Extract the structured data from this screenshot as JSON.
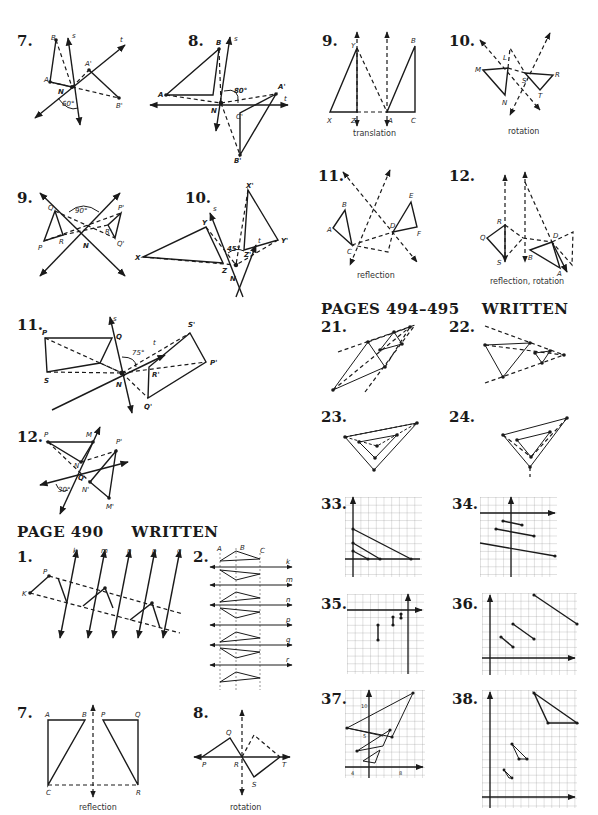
{
  "sections": {
    "page_490_written": "PAGE 490",
    "page_490_written_tag": "WRITTEN",
    "pages_494_495": "PAGES 494–495",
    "pages_494_495_tag": "WRITTEN"
  },
  "exercises": {
    "left_7": {
      "number": "7.",
      "angle": "60°"
    },
    "left_8": {
      "number": "8.",
      "angle": "80°"
    },
    "left_9": {
      "number": "9.",
      "angle": "90°"
    },
    "left_10": {
      "number": "10.",
      "angle": "45°"
    },
    "left_11": {
      "number": "11.",
      "angle": "75°"
    },
    "left_12": {
      "number": "12.",
      "angle": "30°"
    },
    "right_9": {
      "number": "9.",
      "caption": "translation"
    },
    "right_10": {
      "number": "10.",
      "caption": "rotation"
    },
    "right_11": {
      "number": "11.",
      "caption": "reflection"
    },
    "right_12": {
      "number": "12.",
      "caption": "reflection, rotation"
    },
    "ex_21": {
      "number": "21."
    },
    "ex_22": {
      "number": "22."
    },
    "ex_23": {
      "number": "23."
    },
    "ex_24": {
      "number": "24."
    },
    "ex_33": {
      "number": "33."
    },
    "ex_34": {
      "number": "34."
    },
    "ex_35": {
      "number": "35."
    },
    "ex_36": {
      "number": "36."
    },
    "ex_37": {
      "number": "37.",
      "tick_labels": [
        "10",
        "5",
        "4",
        "8"
      ]
    },
    "ex_38": {
      "number": "38."
    },
    "w_1": {
      "number": "1."
    },
    "w_2": {
      "number": "2."
    },
    "w_7": {
      "number": "7.",
      "caption": "reflection"
    },
    "w_8": {
      "number": "8.",
      "caption": "rotation"
    }
  },
  "labels": {
    "A": "A",
    "B": "B",
    "C": "C",
    "N": "N",
    "s": "s",
    "t": "t",
    "Ap": "A'",
    "Bp": "B'",
    "Cp": "C'",
    "P": "P",
    "Q": "Q",
    "R": "R",
    "S": "S",
    "T": "T",
    "Pp": "P'",
    "Qp": "Q'",
    "Rp": "R'",
    "Sp": "S'",
    "X": "X",
    "Y": "Y",
    "Z": "Z",
    "Xp": "X'",
    "Yp": "Y'",
    "Zp": "Z'",
    "M": "M",
    "Mp": "M'",
    "Np": "N'",
    "L": "L",
    "D": "D",
    "E": "E",
    "F": "F",
    "K": "K",
    "k": "k",
    "m": "m",
    "n": "n",
    "p": "p",
    "q": "q",
    "r": "r"
  }
}
